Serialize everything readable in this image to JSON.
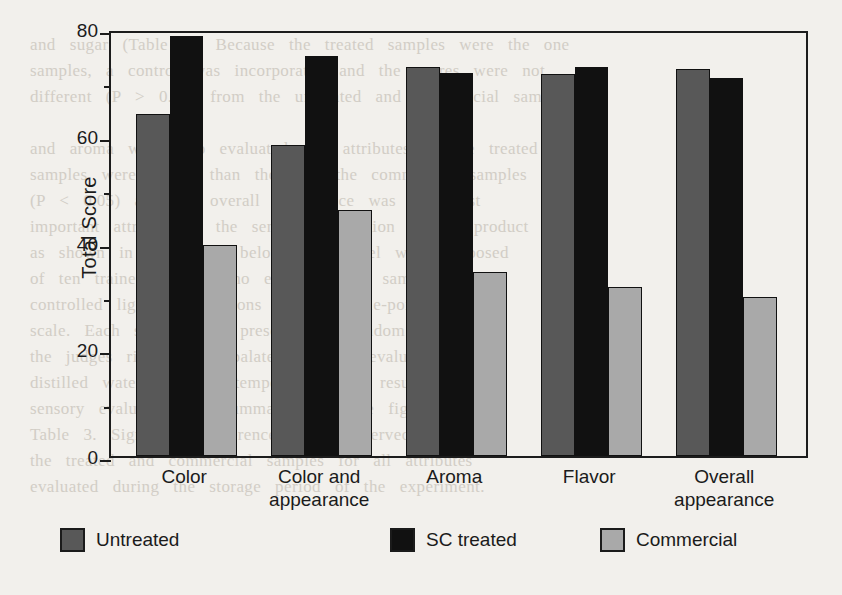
{
  "chart_data": {
    "type": "bar",
    "title": "",
    "xlabel": "",
    "ylabel": "Total Score",
    "ylim": [
      0,
      80
    ],
    "yticks": [
      0,
      20,
      40,
      60,
      80
    ],
    "ytick_labels": [
      "0",
      "20",
      "40",
      "60",
      "80"
    ],
    "yminor_ticks": [
      10,
      30,
      50,
      70
    ],
    "grid": false,
    "legend_position": "bottom",
    "categories": [
      "Color",
      "Color and appearance",
      "Aroma",
      "Flavor",
      "Overall appearance"
    ],
    "category_lines": [
      [
        "Color"
      ],
      [
        "Color and",
        "appearance"
      ],
      [
        "Aroma"
      ],
      [
        "Flavor"
      ],
      [
        "Overall",
        "appearance"
      ]
    ],
    "series": [
      {
        "name": "Untreated",
        "color": "#585858",
        "values": [
          64.0,
          58.2,
          72.8,
          71.5,
          72.6
        ]
      },
      {
        "name": "SC treated",
        "color": "#111111",
        "values": [
          78.6,
          75.0,
          71.8,
          72.9,
          70.9
        ]
      },
      {
        "name": "Commercial",
        "color": "#a9a9a9",
        "values": [
          39.6,
          46.0,
          34.5,
          31.6,
          29.8
        ]
      }
    ]
  },
  "legend": {
    "items": [
      {
        "label": "Untreated",
        "color": "#585858"
      },
      {
        "label": "SC treated",
        "color": "#111111"
      },
      {
        "label": "Commercial",
        "color": "#a9a9a9"
      }
    ]
  },
  "axis": {
    "y_title": "Total Score"
  },
  "page_background_text": "                                                                                  \n   and   sugar   (Table   2).   Because   the   treated   samples   were   the   one\n   samples,   a   control   was   incorporated   and   the   scores   were   not\n   different   (P   >   0.05)   from   the   untreated   and   commercial   samples\n\n   and   aroma   were   also   evaluated.   All   attributes   of   the   treated\n   samples   were   higher   than   those   of   the   commercial   samples\n   (P   <   0.05)   and   the   overall   appearance   was   the   most\n   important   attribute   in   the   sensory   evaluation   of   the   product\n   as   shown   in   the   figure   below.   The   panel   was   composed\n   of   ten   trained   judges   who   evaluated   the   samples   under\n   controlled   lighting   conditions   using   a   nine-point   hedonic\n   scale.   Each   sample   was   presented   in   random   order   and\n   the   judges   rinsed   their   palates   between   evaluations   with\n   distilled   water   at   room   temperature.   The   results   of   the\n   sensory   evaluation   are   summarized   in   the   figure   and   in\n   Table   3.   Significant   differences   were   observed   between\n   the   treated   and   commercial   samples   for   all   attributes\n   evaluated   during   the   storage   period   of   the   experiment.\n\n\n\n\n\n\n\n\n\n\n\n\n\n\n\n\n\n\n\n   for   the   untreated   and   treated   samples.   SC   treated   samples\n   maintained   a   better   appearance   from   the   beginning   and   the\n   final   score.   Color   and   appearance   were   also   correlated   with\n   the   overall   appearance.   The   treated   samples   scored   higher."
}
